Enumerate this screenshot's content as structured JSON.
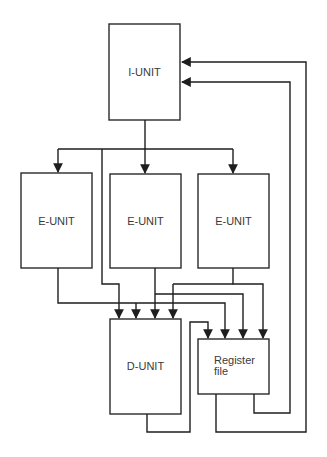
{
  "diagram": {
    "type": "block-diagram",
    "nodes": [
      {
        "id": "i_unit",
        "label": "I-UNIT"
      },
      {
        "id": "e_unit_1",
        "label": "E-UNIT"
      },
      {
        "id": "e_unit_2",
        "label": "E-UNIT"
      },
      {
        "id": "e_unit_3",
        "label": "E-UNIT"
      },
      {
        "id": "d_unit",
        "label": "D-UNIT"
      },
      {
        "id": "register_file",
        "label_line1": "Register",
        "label_line2": "file"
      }
    ],
    "edges": [
      {
        "from": "i_unit",
        "to": "e_unit_1"
      },
      {
        "from": "i_unit",
        "to": "e_unit_2"
      },
      {
        "from": "i_unit",
        "to": "e_unit_3"
      },
      {
        "from": "i_unit",
        "to": "d_unit"
      },
      {
        "from": "e_unit_1",
        "to": "d_unit"
      },
      {
        "from": "e_unit_1",
        "to": "register_file"
      },
      {
        "from": "e_unit_2",
        "to": "d_unit"
      },
      {
        "from": "e_unit_2",
        "to": "register_file"
      },
      {
        "from": "e_unit_3",
        "to": "d_unit"
      },
      {
        "from": "e_unit_3",
        "to": "register_file"
      },
      {
        "from": "d_unit",
        "to": "register_file"
      },
      {
        "from": "register_file",
        "to": "i_unit"
      },
      {
        "from": "register_file",
        "to": "i_unit"
      }
    ],
    "colors": {
      "stroke": "#1e1e1e",
      "text": "#3a3a3a",
      "background": "#ffffff"
    }
  }
}
